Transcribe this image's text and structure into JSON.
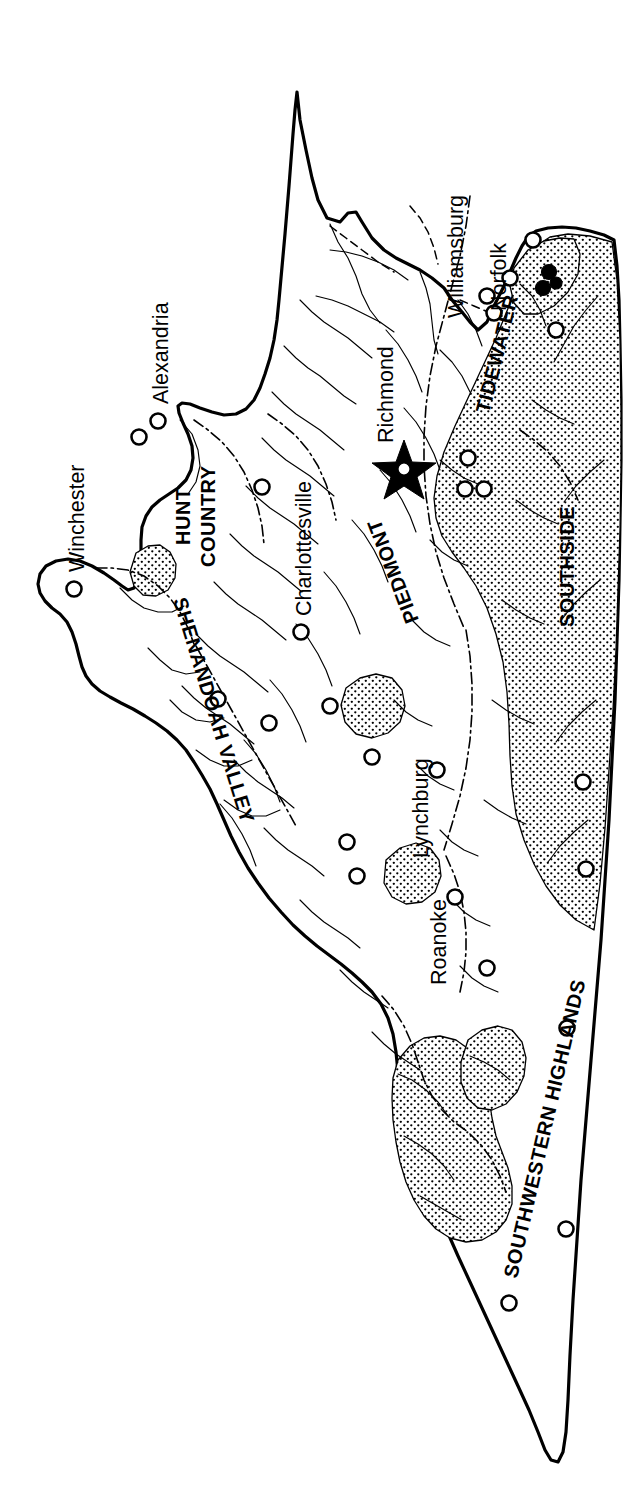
{
  "figure": {
    "orientation": "rotated-90-counterclockwise",
    "background_color": "#ffffff",
    "ink_color": "#000000"
  },
  "regions": [
    {
      "id": "hunt-country",
      "label": "HUNT\nCOUNTRY",
      "line1": "HUNT",
      "line2": "COUNTRY"
    },
    {
      "id": "shenandoah-valley",
      "label": "SHENANDOAH VALLEY"
    },
    {
      "id": "piedmont",
      "label": "PIEDMONT"
    },
    {
      "id": "tidewater",
      "label": "TIDEWATER"
    },
    {
      "id": "southside",
      "label": "SOUTHSIDE"
    },
    {
      "id": "southwestern-highlands",
      "label": "SOUTHWESTERN HIGHLANDS"
    }
  ],
  "cities": [
    {
      "id": "alexandria",
      "label": "Alexandria",
      "marker": "open-circle"
    },
    {
      "id": "winchester",
      "label": "Winchester",
      "marker": "open-circle"
    },
    {
      "id": "charlottesville",
      "label": "Charlottesville",
      "marker": "open-circle"
    },
    {
      "id": "richmond",
      "label": "Richmond",
      "marker": "star"
    },
    {
      "id": "williamsburg",
      "label": "Williamsburg",
      "marker": "open-circle"
    },
    {
      "id": "norfolk",
      "label": "Norfolk",
      "marker": "open-circle"
    },
    {
      "id": "lynchburg",
      "label": "Lynchburg",
      "marker": "open-circle"
    },
    {
      "id": "roanoke",
      "label": "Roanoke",
      "marker": "open-circle"
    }
  ],
  "legend_semantics": {
    "open_circle": "city / town",
    "filled_circle": "highlighted location",
    "star": "state capital",
    "stipple": "shaded region",
    "dash_dot": "region boundary",
    "thin_line": "county boundary",
    "thick_line": "state boundary / coastline"
  },
  "region_label_text": {
    "hunt_country_line1": "HUNT",
    "hunt_country_line2": "COUNTRY",
    "shenandoah_valley": "SHENANDOAH VALLEY",
    "piedmont": "PIEDMONT",
    "tidewater": "TIDEWATER",
    "southside": "SOUTHSIDE",
    "southwestern_highlands": "SOUTHWESTERN HIGHLANDS"
  },
  "city_label_text": {
    "alexandria": "Alexandria",
    "winchester": "Winchester",
    "charlottesville": "Charlottesville",
    "richmond": "Richmond",
    "williamsburg": "Williamsburg",
    "norfolk": "Norfolk",
    "lynchburg": "Lynchburg",
    "roanoke": "Roanoke"
  }
}
